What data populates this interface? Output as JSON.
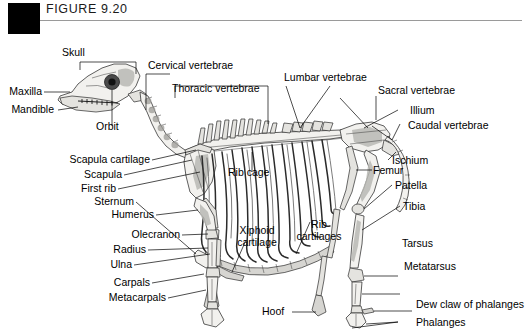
{
  "figure": {
    "header_label": "FIGURE 9.20",
    "marker_color": "#000000",
    "rule_color": "#9a9a9a",
    "background_color": "#ffffff"
  },
  "labels": {
    "skull": "Skull",
    "maxilla": "Maxilla",
    "mandible": "Mandible",
    "orbit": "Orbit",
    "cervical_vertebrae": "Cervical vertebrae",
    "thoracic_vertebrae": "Thoracic vertebrae",
    "lumbar_vertebrae": "Lumbar vertebrae",
    "sacral_vertebrae": "Sacral vertebrae",
    "illium": "Illium",
    "caudal_vertebrae": "Caudal vertebrae",
    "ischium": "Ischium",
    "femur": "Femur",
    "patella": "Patella",
    "tibia": "Tibia",
    "tarsus": "Tarsus",
    "metatarsus": "Metatarsus",
    "dew_claw_of_phalanges": "Dew claw of phalanges",
    "phalanges": "Phalanges",
    "hoof": "Hoof",
    "scapula_cartilage": "Scapula cartilage",
    "scapula": "Scapula",
    "first_rib": "First rib",
    "sternum": "Sternum",
    "humerus": "Humerus",
    "olecranon": "Olecranon",
    "radius": "Radius",
    "ulna": "Ulna",
    "carpals": "Carpals",
    "metacarpals": "Metacarpals",
    "rib_cage": "Rib cage",
    "xiphoid_cartilage": "Xiphoid cartilage",
    "rib_cartilages": "Rib cartilages"
  }
}
